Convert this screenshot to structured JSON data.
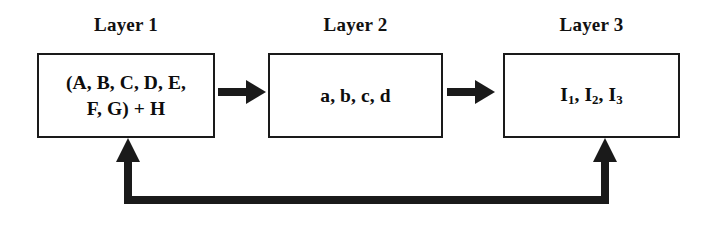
{
  "diagram": {
    "background_color": "#ffffff",
    "line_color": "#1a1a1a",
    "text_color": "#0d0d0d",
    "labels": {
      "layer1": "Layer 1",
      "layer2": "Layer 2",
      "layer3": "Layer 3"
    },
    "boxes": {
      "box1": {
        "line1": "(A, B, C, D, E,",
        "line2": "F, G) + H"
      },
      "box2": {
        "content": "a, b, c, d"
      },
      "box3": {
        "item1_base": "I",
        "item1_sub": "1",
        "item2_base": "I",
        "item2_sub": "2",
        "item3_base": "I",
        "item3_sub": "3",
        "separator1": ", ",
        "separator2": ", "
      }
    },
    "connectors": {
      "arrow1": "forward-arrow-layer1-to-layer2",
      "arrow2": "forward-arrow-layer2-to-layer3",
      "feedback": "feedback-arrow-layer3-to-layer1"
    }
  }
}
